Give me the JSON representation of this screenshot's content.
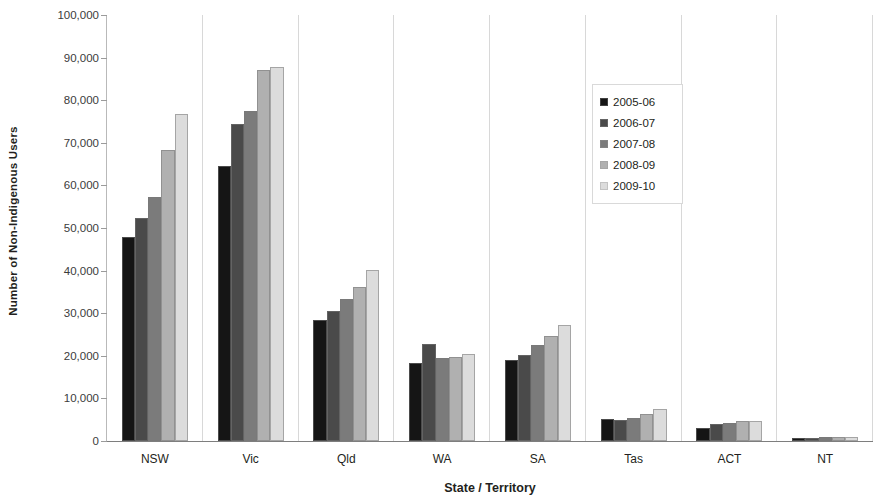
{
  "chart_data": {
    "type": "bar",
    "title": "",
    "subtitle": "",
    "xlabel": "State / Territory",
    "ylabel": "Number of Non-Indigenous Users",
    "categories": [
      "NSW",
      "Vic",
      "Qld",
      "WA",
      "SA",
      "Tas",
      "ACT",
      "NT"
    ],
    "ylim": [
      0,
      100000
    ],
    "ytick_values": [
      0,
      10000,
      20000,
      30000,
      40000,
      50000,
      60000,
      70000,
      80000,
      90000,
      100000
    ],
    "ytick_labels": [
      "0",
      "10,000",
      "20,000",
      "30,000",
      "40,000",
      "50,000",
      "60,000",
      "70,000",
      "80,000",
      "90,000",
      "100,000"
    ],
    "grid": false,
    "legend_position": "upper right inside",
    "series": [
      {
        "name": "2005-06",
        "color": "#151515",
        "values": [
          47900,
          64600,
          28400,
          18300,
          19000,
          5100,
          3100,
          600
        ]
      },
      {
        "name": "2006-07",
        "color": "#4a4a4a",
        "values": [
          52300,
          74400,
          30500,
          22700,
          20200,
          5000,
          3900,
          700
        ]
      },
      {
        "name": "2007-08",
        "color": "#7b7b7b",
        "values": [
          57300,
          77500,
          33300,
          19600,
          22500,
          5500,
          4300,
          900
        ]
      },
      {
        "name": "2008-09",
        "color": "#b0b0b0",
        "values": [
          68300,
          87100,
          36200,
          19800,
          24600,
          6400,
          4800,
          1000
        ]
      },
      {
        "name": "2009-10",
        "color": "#dcdcdc",
        "values": [
          76700,
          87800,
          40200,
          20400,
          27200,
          7600,
          4800,
          900
        ]
      }
    ]
  }
}
